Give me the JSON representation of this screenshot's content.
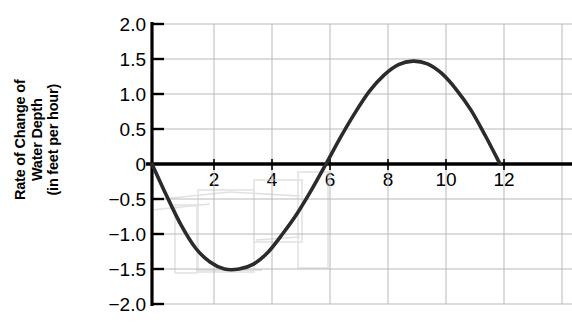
{
  "axis": {
    "y_label_lines": [
      "Rate of Change of",
      "Water Depth",
      "(in feet per hour)"
    ],
    "y_label_full": "Rate of Change of Water Depth (in feet per hour)",
    "y_ticks": [
      "2.0",
      "1.5",
      "1.0",
      "0.5",
      "0",
      "−0.5",
      "−1.0",
      "−1.5",
      "−2.0"
    ],
    "x_ticks": [
      "2",
      "4",
      "6",
      "8",
      "10",
      "12"
    ]
  },
  "colors": {
    "curve": "#2b2b2b",
    "axis": "#000000",
    "grid": "#b9b9b9",
    "background": "#ffffff",
    "pencil": "#c9c9c9"
  },
  "chart_data": {
    "type": "line",
    "title": "",
    "xlabel": "",
    "ylabel": "Rate of Change of Water Depth (in feet per hour)",
    "xlim": [
      0,
      13
    ],
    "ylim": [
      -2.0,
      2.0
    ],
    "grid": true,
    "legend": "none",
    "x_tick_values": [
      2,
      4,
      6,
      8,
      10,
      12
    ],
    "y_tick_values": [
      2.0,
      1.5,
      1.0,
      0.5,
      0,
      -0.5,
      -1.0,
      -1.5,
      -2.0
    ],
    "annotations": [
      "zero crossings at x = 0, 6, 12",
      "minimum approximately -1.5 at x = 3",
      "maximum approximately 1.47 at x = 9"
    ],
    "series": [
      {
        "name": "Rate of change of water depth",
        "x": [
          0,
          0.5,
          1,
          1.5,
          2,
          2.5,
          3,
          3.5,
          4,
          4.5,
          5,
          5.5,
          6,
          6.5,
          7,
          7.5,
          8,
          8.5,
          9,
          9.5,
          10,
          10.5,
          11,
          11.5,
          12
        ],
        "y": [
          0,
          -0.45,
          -0.87,
          -1.2,
          -1.4,
          -1.5,
          -1.5,
          -1.43,
          -1.26,
          -1.0,
          -0.71,
          -0.37,
          0,
          0.38,
          0.73,
          1.04,
          1.27,
          1.42,
          1.47,
          1.43,
          1.29,
          1.06,
          0.77,
          0.4,
          0
        ]
      }
    ]
  }
}
